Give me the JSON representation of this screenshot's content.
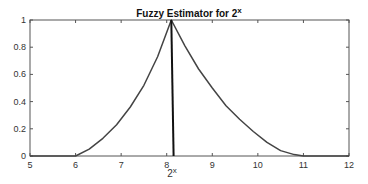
{
  "chart_data": {
    "type": "line",
    "title_base": "Fuzzy Estimator for 2",
    "title_sup": "x",
    "xlabel": "2^x",
    "xlabel_base": "2",
    "xlabel_sup": "x",
    "ylabel": "",
    "xlim": [
      5,
      12
    ],
    "ylim": [
      0,
      1
    ],
    "xticks": [
      5,
      6,
      7,
      8,
      9,
      10,
      11,
      12
    ],
    "xtick_labels": [
      "5",
      "6",
      "7",
      "8",
      "9",
      "10",
      "11",
      "12"
    ],
    "yticks": [
      0,
      0.2,
      0.4,
      0.6,
      0.8,
      1
    ],
    "ytick_labels": [
      "0",
      "0.2",
      "0.4",
      "0.6",
      "0.8",
      "1"
    ],
    "grid": false,
    "legend": null,
    "series": [
      {
        "name": "membership",
        "color": "#444444",
        "x": [
          5,
          6,
          6.3,
          6.6,
          6.9,
          7.2,
          7.5,
          7.8,
          8.1,
          8.4,
          8.7,
          9.0,
          9.3,
          9.6,
          9.9,
          10.2,
          10.5,
          10.8,
          11,
          12
        ],
        "y": [
          0,
          0,
          0.05,
          0.13,
          0.23,
          0.36,
          0.52,
          0.73,
          1.0,
          0.81,
          0.64,
          0.5,
          0.37,
          0.27,
          0.18,
          0.1,
          0.04,
          0.01,
          0,
          0
        ]
      },
      {
        "name": "crisp-value",
        "color": "#111111",
        "x": [
          8.1,
          8.15
        ],
        "y": [
          1,
          0
        ]
      }
    ],
    "colors": {
      "axis": "#555555",
      "curve": "#444444",
      "crisp_line": "#111111"
    }
  }
}
